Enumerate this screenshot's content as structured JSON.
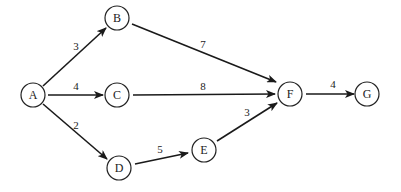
{
  "diagram": {
    "type": "directed-weighted-graph",
    "nodes": [
      {
        "id": "A",
        "label": "A",
        "x": 33,
        "y": 95
      },
      {
        "id": "B",
        "label": "B",
        "x": 117,
        "y": 18
      },
      {
        "id": "C",
        "label": "C",
        "x": 117,
        "y": 95
      },
      {
        "id": "D",
        "label": "D",
        "x": 119,
        "y": 168
      },
      {
        "id": "E",
        "label": "E",
        "x": 204,
        "y": 150
      },
      {
        "id": "F",
        "label": "F",
        "x": 290,
        "y": 94
      },
      {
        "id": "G",
        "label": "G",
        "x": 336,
        "y": 94
      }
    ],
    "edges": [
      {
        "from": "A",
        "to": "B",
        "weight": "3"
      },
      {
        "from": "A",
        "to": "C",
        "weight": "4"
      },
      {
        "from": "A",
        "to": "D",
        "weight": "2"
      },
      {
        "from": "B",
        "to": "F",
        "weight": "7"
      },
      {
        "from": "C",
        "to": "F",
        "weight": "8"
      },
      {
        "from": "D",
        "to": "E",
        "weight": "5"
      },
      {
        "from": "E",
        "to": "F",
        "weight": "3"
      },
      {
        "from": "F",
        "to": "G",
        "weight": "4"
      }
    ]
  }
}
